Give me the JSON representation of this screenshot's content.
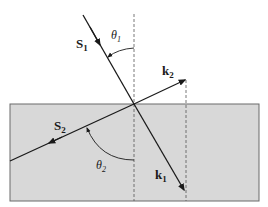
{
  "colors": {
    "medium_fill": "#d8d8d8",
    "medium_stroke": "#6a6a6a",
    "line": "#1a1a1a",
    "dashed": "#555555",
    "background": "#ffffff"
  },
  "labels": {
    "s1": {
      "main": "S",
      "sub": "1"
    },
    "s2": {
      "main": "S",
      "sub": "2"
    },
    "k1": {
      "main": "k",
      "sub": "1"
    },
    "k2": {
      "main": "k",
      "sub": "2"
    },
    "theta1": {
      "main": "θ",
      "sub": "1"
    },
    "theta2": {
      "main": "θ",
      "sub": "2"
    }
  },
  "elements": [
    "upper medium (white)",
    "lower medium (grey slab)",
    "dashed normal through interface point",
    "ray S1 incident from upper-left with arrow",
    "ray S2 continuing to lower-left with arrow",
    "vector k1 pointing to lower-right",
    "vector k2 pointing to upper-right",
    "dashed vertical projection from k2/k1 tips",
    "angle arc theta1 between normal and S1",
    "angle arc theta2 between lower normal and S2"
  ]
}
